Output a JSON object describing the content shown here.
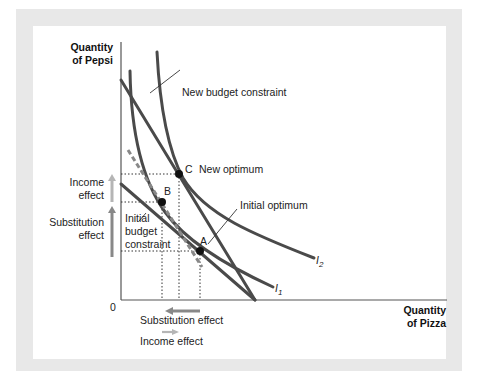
{
  "diagram": {
    "type": "income-substitution-effect",
    "axes": {
      "y_label_line1": "Quantity",
      "y_label_line2": "of Pepsi",
      "x_label_line1": "Quantity",
      "x_label_line2": "of Pizza",
      "origin_label": "0"
    },
    "curves": {
      "indifference_1": "I",
      "indifference_1_sub": "1",
      "indifference_2": "I",
      "indifference_2_sub": "2"
    },
    "points": {
      "a": "A",
      "b": "B",
      "c": "C"
    },
    "annotations": {
      "new_budget": "New budget constraint",
      "new_optimum": "New optimum",
      "initial_optimum": "Initial optimum",
      "initial_budget_line1": "Initial",
      "initial_budget_line2": "budget",
      "initial_budget_line3": "constraint"
    },
    "vertical_effects": {
      "income_line1": "Income",
      "income_line2": "effect",
      "substitution_line1": "Substitution",
      "substitution_line2": "effect"
    },
    "horizontal_effects": {
      "substitution": "Substitution effect",
      "income": "Income effect"
    },
    "colors": {
      "curve": "#4a4a4a",
      "dashed": "#888888",
      "arrow_dark": "#888888",
      "arrow_light": "#b5b5b5",
      "frame": "#e8e8e8"
    }
  }
}
